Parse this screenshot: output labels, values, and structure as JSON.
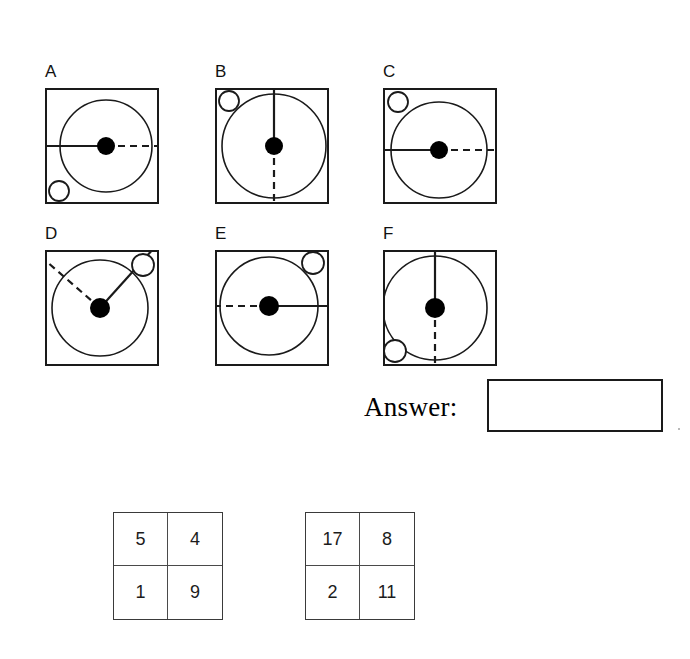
{
  "page": {
    "header_fragment": "",
    "answer_label": "Answer:",
    "answer_value": ""
  },
  "puzzle": {
    "title": "",
    "panels": [
      {
        "label": "A",
        "x": 45,
        "y": 88,
        "big_circle": {
          "cx": 61,
          "cy": 58,
          "r": 46
        },
        "dot": {
          "cx": 61,
          "cy": 58,
          "r": 9
        },
        "solid_line_angle_deg": 180,
        "dashed_line_angle_deg": 0,
        "small_circle": {
          "cx": 14,
          "cy": 103,
          "r": 10,
          "position": "bottom-left"
        }
      },
      {
        "label": "B",
        "x": 215,
        "y": 88,
        "big_circle": {
          "cx": 59,
          "cy": 58,
          "r": 52
        },
        "dot": {
          "cx": 59,
          "cy": 58,
          "r": 9
        },
        "solid_line_angle_deg": 90,
        "dashed_line_angle_deg": 270,
        "small_circle": {
          "cx": 14,
          "cy": 13,
          "r": 10,
          "position": "top-left"
        }
      },
      {
        "label": "C",
        "x": 383,
        "y": 88,
        "big_circle": {
          "cx": 56,
          "cy": 62,
          "r": 48
        },
        "dot": {
          "cx": 56,
          "cy": 62,
          "r": 9
        },
        "solid_line_angle_deg": 180,
        "dashed_line_angle_deg": 0,
        "small_circle": {
          "cx": 15,
          "cy": 14,
          "r": 10,
          "position": "top-left"
        }
      },
      {
        "label": "D",
        "x": 45,
        "y": 250,
        "big_circle": {
          "cx": 55,
          "cy": 58,
          "r": 48
        },
        "dot": {
          "cx": 55,
          "cy": 58,
          "r": 10
        },
        "solid_line_angle_deg": 48,
        "dashed_line_angle_deg": 139,
        "small_circle": {
          "cx": 98,
          "cy": 15,
          "r": 11,
          "position": "top-right"
        }
      },
      {
        "label": "E",
        "x": 215,
        "y": 250,
        "big_circle": {
          "cx": 54,
          "cy": 56,
          "r": 49
        },
        "dot": {
          "cx": 54,
          "cy": 56,
          "r": 10
        },
        "solid_line_angle_deg": 0,
        "dashed_line_angle_deg": 180,
        "small_circle": {
          "cx": 98,
          "cy": 13,
          "r": 11,
          "position": "top-right"
        }
      },
      {
        "label": "F",
        "x": 383,
        "y": 250,
        "big_circle": {
          "cx": 52,
          "cy": 58,
          "r": 52
        },
        "dot": {
          "cx": 52,
          "cy": 58,
          "r": 10
        },
        "solid_line_angle_deg": 90,
        "dashed_line_angle_deg": 270,
        "small_circle": {
          "cx": 12,
          "cy": 101,
          "r": 11,
          "position": "bottom-left"
        }
      }
    ]
  },
  "number_grids": [
    {
      "name": "grid-left",
      "rows": [
        [
          "5",
          "4"
        ],
        [
          "1",
          "9"
        ]
      ]
    },
    {
      "name": "grid-right",
      "rows": [
        [
          "17",
          "8"
        ],
        [
          "2",
          "11"
        ]
      ]
    }
  ],
  "colors": {
    "ink": "#111111",
    "line": "#1a1a1a",
    "grid_line": "#4a4a4a",
    "background": "#ffffff"
  }
}
